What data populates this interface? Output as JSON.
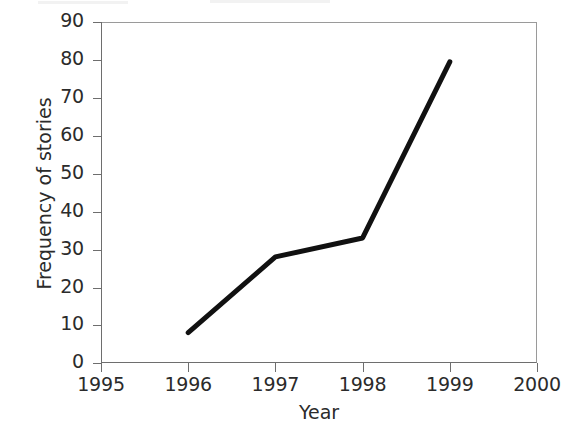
{
  "chart_data": {
    "type": "line",
    "title": "",
    "subtitle": "",
    "xlabel": "Year",
    "ylabel": "Frequency of stories",
    "x": [
      1996,
      1997,
      1998,
      1999
    ],
    "values": [
      8,
      28,
      33,
      79.5
    ],
    "series": [
      {
        "name": "Frequency of stories",
        "x": [
          1996,
          1997,
          1998,
          1999
        ],
        "values": [
          8,
          28,
          33,
          79.5
        ],
        "color": "#111111",
        "line_width": 5,
        "markers": "none"
      }
    ],
    "xlim": [
      1995,
      2000
    ],
    "ylim": [
      0,
      90
    ],
    "xticks": [
      1995,
      1996,
      1997,
      1998,
      1999,
      2000
    ],
    "yticks": [
      0,
      10,
      20,
      30,
      40,
      50,
      60,
      70,
      80,
      90
    ],
    "xticklabels": [
      "1995",
      "1996",
      "1997",
      "1998",
      "1999",
      "2000"
    ],
    "yticklabels": [
      "0",
      "10",
      "20",
      "30",
      "40",
      "50",
      "60",
      "70",
      "80",
      "90"
    ],
    "grid": false,
    "legend": "none",
    "annotations": []
  },
  "axes": {
    "x_title": "Year",
    "y_title": "Frequency of stories",
    "x_tick_labels": [
      "1995",
      "1996",
      "1997",
      "1998",
      "1999",
      "2000"
    ],
    "y_tick_labels": [
      "0",
      "10",
      "20",
      "30",
      "40",
      "50",
      "60",
      "70",
      "80",
      "90"
    ]
  },
  "colors": {
    "line": "#111111",
    "axis": "#6e6e6e",
    "frame": "#9a9a9a",
    "text": "#2b2b2b",
    "background": "#ffffff"
  }
}
